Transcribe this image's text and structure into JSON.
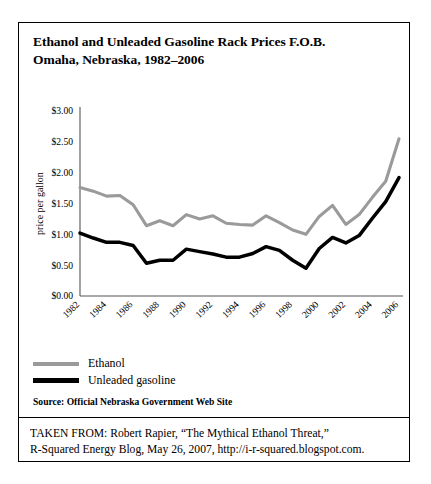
{
  "figure": {
    "title_line1": "Ethanol and Unleaded Gasoline Rack Prices F.O.B.",
    "title_line2": "Omaha, Nebraska, 1982–2006",
    "source_note": "Source: Official Nebraska Government Web Site",
    "attribution_line1": "TAKEN FROM: Robert Rapier, “The Mythical Ethanol Threat,”",
    "attribution_line2": "R-Squared Energy Blog, May 26, 2007, http://i-r-squared.blogspot.com."
  },
  "legend": {
    "items": [
      {
        "label": "Ethanol",
        "color": "#9a9a9a"
      },
      {
        "label": "Unleaded gasoline",
        "color": "#000000"
      }
    ]
  },
  "chart_data": {
    "type": "line",
    "title": "Ethanol and Unleaded Gasoline Rack Prices F.O.B. Omaha, Nebraska, 1982–2006",
    "xlabel": "",
    "ylabel": "price per gallon",
    "xlim": [
      1982,
      2006
    ],
    "ylim": [
      0.0,
      3.0
    ],
    "ytick_labels": [
      "$3.00",
      "$2.50",
      "$2.00",
      "$1.50",
      "$1.00",
      "$0.50",
      "$0.00"
    ],
    "ytick_values": [
      3.0,
      2.5,
      2.0,
      1.5,
      1.0,
      0.5,
      0.0
    ],
    "xtick_labels": [
      "1982",
      "1984",
      "1986",
      "1988",
      "1990",
      "1992",
      "1994",
      "1996",
      "1998",
      "2000",
      "2002",
      "2004",
      "2006"
    ],
    "xtick_values": [
      1982,
      1984,
      1986,
      1988,
      1990,
      1992,
      1994,
      1996,
      1998,
      2000,
      2002,
      2004,
      2006
    ],
    "grid": false,
    "legend_position": "below-plot",
    "x": [
      1982,
      1983,
      1984,
      1985,
      1986,
      1987,
      1988,
      1989,
      1990,
      1991,
      1992,
      1993,
      1994,
      1995,
      1996,
      1997,
      1998,
      1999,
      2000,
      2001,
      2002,
      2003,
      2004,
      2005,
      2006
    ],
    "series": [
      {
        "name": "Ethanol",
        "color": "#9a9a9a",
        "values": [
          1.76,
          1.7,
          1.62,
          1.63,
          1.48,
          1.14,
          1.22,
          1.14,
          1.32,
          1.25,
          1.3,
          1.18,
          1.16,
          1.15,
          1.3,
          1.19,
          1.07,
          1.0,
          1.29,
          1.47,
          1.16,
          1.32,
          1.6,
          1.86,
          2.55
        ]
      },
      {
        "name": "Unleaded gasoline",
        "color": "#000000",
        "values": [
          1.02,
          0.94,
          0.87,
          0.87,
          0.82,
          0.53,
          0.58,
          0.58,
          0.76,
          0.72,
          0.68,
          0.63,
          0.63,
          0.69,
          0.8,
          0.74,
          0.58,
          0.45,
          0.77,
          0.95,
          0.86,
          0.98,
          1.26,
          1.53,
          1.92
        ]
      }
    ]
  }
}
